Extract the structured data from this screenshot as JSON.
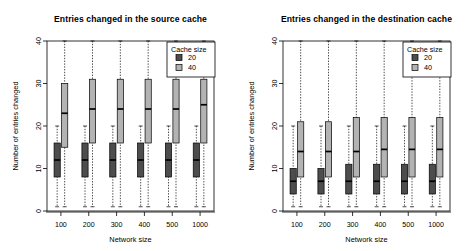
{
  "figure": {
    "background": "#ffffff",
    "colors": {
      "cache20": "#4d4d4d",
      "cache40": "#b3b3b3",
      "axis": "#000000",
      "box_border": "#000000"
    }
  },
  "chart_data": [
    {
      "type": "bar",
      "chart_kind": "boxplot-grouped",
      "title": "Entries changed in the source cache",
      "xlabel": "Network size",
      "ylabel": "Number of entries changed",
      "categories": [
        "100",
        "200",
        "300",
        "400",
        "500",
        "1000"
      ],
      "yticks": [
        0,
        10,
        20,
        30,
        40
      ],
      "ylim": [
        0,
        40
      ],
      "grid": false,
      "legend": {
        "title": "Cache size",
        "position": "top-right-inside",
        "entries": [
          {
            "label": "20",
            "color": "#4d4d4d"
          },
          {
            "label": "40",
            "color": "#b3b3b3"
          }
        ]
      },
      "series": [
        {
          "name": "20",
          "color": "#4d4d4d",
          "boxes": [
            {
              "category": "100",
              "whisker_low": 1,
              "q1": 8,
              "median": 12,
              "q3": 16,
              "whisker_high": 20
            },
            {
              "category": "200",
              "whisker_low": 1,
              "q1": 8,
              "median": 12,
              "q3": 16,
              "whisker_high": 20
            },
            {
              "category": "300",
              "whisker_low": 1,
              "q1": 8,
              "median": 12,
              "q3": 16,
              "whisker_high": 20
            },
            {
              "category": "400",
              "whisker_low": 1,
              "q1": 8,
              "median": 12,
              "q3": 16,
              "whisker_high": 20
            },
            {
              "category": "500",
              "whisker_low": 1,
              "q1": 8,
              "median": 12,
              "q3": 16,
              "whisker_high": 20
            },
            {
              "category": "1000",
              "whisker_low": 1,
              "q1": 8,
              "median": 12,
              "q3": 16,
              "whisker_high": 20
            }
          ]
        },
        {
          "name": "40",
          "color": "#b3b3b3",
          "boxes": [
            {
              "category": "100",
              "whisker_low": 1,
              "q1": 15,
              "median": 23,
              "q3": 30,
              "whisker_high": 40
            },
            {
              "category": "200",
              "whisker_low": 1,
              "q1": 16,
              "median": 24,
              "q3": 31,
              "whisker_high": 40
            },
            {
              "category": "300",
              "whisker_low": 1,
              "q1": 16,
              "median": 24,
              "q3": 31,
              "whisker_high": 40
            },
            {
              "category": "400",
              "whisker_low": 1,
              "q1": 16,
              "median": 24,
              "q3": 31,
              "whisker_high": 40
            },
            {
              "category": "500",
              "whisker_low": 1,
              "q1": 16,
              "median": 24,
              "q3": 31,
              "whisker_high": 40
            },
            {
              "category": "1000",
              "whisker_low": 1,
              "q1": 16,
              "median": 25,
              "q3": 31,
              "whisker_high": 40
            }
          ]
        }
      ]
    },
    {
      "type": "bar",
      "chart_kind": "boxplot-grouped",
      "title": "Entries changed in the destination cache",
      "xlabel": "Network size",
      "ylabel": "Number of entries changed",
      "categories": [
        "100",
        "200",
        "300",
        "400",
        "500",
        "1000"
      ],
      "yticks": [
        0,
        10,
        20,
        30,
        40
      ],
      "ylim": [
        0,
        40
      ],
      "grid": false,
      "legend": {
        "title": "Cache size",
        "position": "top-right-inside",
        "entries": [
          {
            "label": "20",
            "color": "#4d4d4d"
          },
          {
            "label": "40",
            "color": "#b3b3b3"
          }
        ]
      },
      "series": [
        {
          "name": "20",
          "color": "#4d4d4d",
          "boxes": [
            {
              "category": "100",
              "whisker_low": 1,
              "q1": 4,
              "median": 7,
              "q3": 10,
              "whisker_high": 20
            },
            {
              "category": "200",
              "whisker_low": 1,
              "q1": 4,
              "median": 7,
              "q3": 10,
              "whisker_high": 20
            },
            {
              "category": "300",
              "whisker_low": 1,
              "q1": 4,
              "median": 7,
              "q3": 11,
              "whisker_high": 20
            },
            {
              "category": "400",
              "whisker_low": 1,
              "q1": 4,
              "median": 7,
              "q3": 11,
              "whisker_high": 20
            },
            {
              "category": "500",
              "whisker_low": 1,
              "q1": 4,
              "median": 7,
              "q3": 11,
              "whisker_high": 20
            },
            {
              "category": "1000",
              "whisker_low": 1,
              "q1": 4,
              "median": 7,
              "q3": 11,
              "whisker_high": 20
            }
          ]
        },
        {
          "name": "40",
          "color": "#b3b3b3",
          "boxes": [
            {
              "category": "100",
              "whisker_low": 1,
              "q1": 8,
              "median": 14,
              "q3": 21,
              "whisker_high": 40
            },
            {
              "category": "200",
              "whisker_low": 1,
              "q1": 8,
              "median": 14,
              "q3": 21,
              "whisker_high": 40
            },
            {
              "category": "300",
              "whisker_low": 1,
              "q1": 8,
              "median": 14,
              "q3": 22,
              "whisker_high": 40
            },
            {
              "category": "400",
              "whisker_low": 1,
              "q1": 8,
              "median": 14.5,
              "q3": 22,
              "whisker_high": 40
            },
            {
              "category": "500",
              "whisker_low": 1,
              "q1": 8,
              "median": 14.5,
              "q3": 22,
              "whisker_high": 40
            },
            {
              "category": "1000",
              "whisker_low": 1,
              "q1": 8,
              "median": 14.5,
              "q3": 22,
              "whisker_high": 40
            }
          ]
        }
      ]
    }
  ]
}
